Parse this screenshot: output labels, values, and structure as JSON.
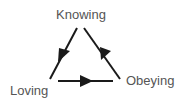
{
  "diagram": {
    "type": "cycle-triangle",
    "nodes": [
      {
        "id": "knowing",
        "label": "Knowing"
      },
      {
        "id": "loving",
        "label": "Loving"
      },
      {
        "id": "obeying",
        "label": "Obeying"
      }
    ],
    "edges": [
      {
        "from": "knowing",
        "to": "loving"
      },
      {
        "from": "loving",
        "to": "obeying"
      },
      {
        "from": "obeying",
        "to": "knowing"
      }
    ],
    "colors": {
      "line": "#1a1a1a",
      "text": "#555555",
      "background": "#ffffff"
    }
  }
}
